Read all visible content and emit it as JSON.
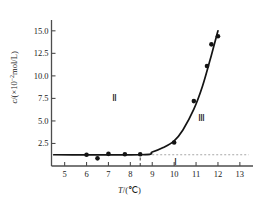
{
  "chart_data": {
    "type": "scatter",
    "title": "",
    "xlabel": "T/(℃)",
    "ylabel": "c/(×10⁻²mol/L)",
    "ylabel_parts": {
      "symbol": "c",
      "slash": "/(",
      "times": "× 10",
      "exponent": "-2",
      "unit": "mol/L)"
    },
    "xlabel_parts": {
      "symbol": "T",
      "slash": "/(",
      "unit": "℃",
      "close": ")"
    },
    "xlim": [
      4.4,
      13.6
    ],
    "ylim": [
      0.0,
      16.2
    ],
    "xticks": [
      5,
      6,
      7,
      8,
      9,
      10,
      11,
      12,
      13
    ],
    "xticklabels": [
      "5",
      "6",
      "7",
      "8",
      "9",
      "10",
      "11",
      "12",
      "13"
    ],
    "yticks": [
      2.5,
      5.0,
      7.5,
      10.0,
      12.5,
      15.0
    ],
    "yticklabels": [
      "2.5",
      "5.0",
      "7.5",
      "10.0",
      "12.5",
      "15.0"
    ],
    "grid": false,
    "legend": null,
    "baseline_value": 1.25,
    "points": [
      {
        "x": 6.0,
        "y": 1.25
      },
      {
        "x": 6.5,
        "y": 0.85
      },
      {
        "x": 7.0,
        "y": 1.35
      },
      {
        "x": 7.75,
        "y": 1.3
      },
      {
        "x": 8.45,
        "y": 1.3
      },
      {
        "x": 10.0,
        "y": 2.6
      },
      {
        "x": 10.9,
        "y": 7.2
      },
      {
        "x": 11.5,
        "y": 11.1
      },
      {
        "x": 11.7,
        "y": 13.5
      },
      {
        "x": 12.0,
        "y": 14.4
      }
    ],
    "fit_curve": [
      {
        "x": 4.5,
        "y": 1.25
      },
      {
        "x": 8.5,
        "y": 1.25
      },
      {
        "x": 9.0,
        "y": 1.55
      },
      {
        "x": 9.5,
        "y": 2.05
      },
      {
        "x": 10.0,
        "y": 2.8
      },
      {
        "x": 10.4,
        "y": 4.0
      },
      {
        "x": 10.9,
        "y": 6.3
      },
      {
        "x": 11.3,
        "y": 8.9
      },
      {
        "x": 11.7,
        "y": 12.3
      },
      {
        "x": 12.0,
        "y": 15.0
      }
    ],
    "dashed_vertical": {
      "x": 8.45,
      "y_from": 0.0,
      "y_to": 1.25
    },
    "dotted_horizontal": {
      "y": 1.25,
      "x_from": 8.45,
      "x_to": 13.4
    },
    "annotations": [
      {
        "text": "Ⅱ",
        "x": 7.4,
        "y": 7.6
      },
      {
        "text": "Ⅲ",
        "x": 11.3,
        "y": 5.3
      },
      {
        "text": "Ⅰ",
        "x": 10.2,
        "y": 0.45
      }
    ],
    "marker": {
      "shape": "circle",
      "color": "#141414",
      "size": 4.6
    },
    "curve_color": "#141414",
    "axis_color": "#4d4d4d",
    "dotted_color": "#a8a8a8"
  }
}
